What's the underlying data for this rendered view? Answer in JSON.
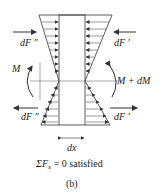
{
  "diagram": {
    "forces": {
      "top_left": "dF ″",
      "top_right": "dF ′",
      "bottom_left": "dF ″",
      "bottom_right": "dF ′"
    },
    "moments": {
      "left": "M",
      "right": "M + dM"
    },
    "width_label": "dx",
    "equation": "ΣF",
    "equation_sub": "x",
    "equation_rest": " = 0 satisfied",
    "caption": "(b)"
  },
  "colors": {
    "line": "#333333",
    "text": "#222222",
    "background": "#ffffff"
  }
}
